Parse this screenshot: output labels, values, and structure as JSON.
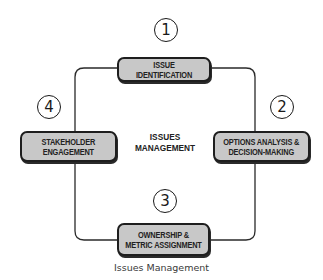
{
  "diagram": {
    "center_title": "ISSUES\nMANAGEMENT",
    "caption": "Issues Management",
    "colors": {
      "box_fill": "#c8c8c8",
      "box_border": "#1e1e1e",
      "line": "#2a2a2a",
      "text": "#222222"
    },
    "steps": [
      {
        "number": "1",
        "label": "ISSUE IDENTIFICATION"
      },
      {
        "number": "2",
        "label": "OPTIONS ANALYSIS &\nDECISION-MAKING"
      },
      {
        "number": "3",
        "label": "OWNERSHIP &\nMETRIC ASSIGNMENT"
      },
      {
        "number": "4",
        "label": "STAKEHOLDER\nENGAGEMENT"
      }
    ]
  }
}
